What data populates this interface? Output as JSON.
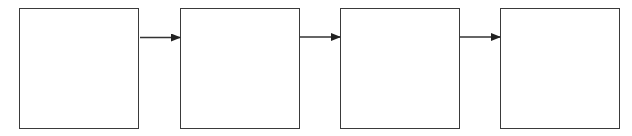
{
  "diagram": {
    "type": "flow",
    "direction": "left-to-right",
    "stroke_color": "#3a3a3a",
    "nodes": [
      {
        "id": "box-1",
        "label": ""
      },
      {
        "id": "box-2",
        "label": ""
      },
      {
        "id": "box-3",
        "label": ""
      },
      {
        "id": "box-4",
        "label": ""
      }
    ],
    "edges": [
      {
        "from": "box-1",
        "to": "box-2"
      },
      {
        "from": "box-2",
        "to": "box-3"
      },
      {
        "from": "box-3",
        "to": "box-4"
      }
    ]
  }
}
